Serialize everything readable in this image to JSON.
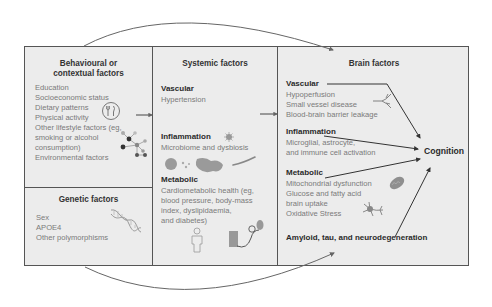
{
  "diagram": {
    "panels": {
      "behavioural": {
        "title_line1": "Behavioural or",
        "title_line2": "contextual factors",
        "items": [
          "Education",
          "Socioeconomic status",
          "Dietary patterns",
          "Physical activity",
          "Other lifestyle factors (eg,",
          "smoking or alcohol",
          "consumption)",
          "Environmental factors"
        ]
      },
      "genetic": {
        "title": "Genetic factors",
        "items": [
          "Sex",
          "APOE4",
          "Other polymorphisms"
        ]
      },
      "systemic": {
        "title": "Systemic factors",
        "vascular": {
          "heading": "Vascular",
          "items": [
            "Hypertension"
          ]
        },
        "inflammation": {
          "heading": "Inflammation",
          "items": [
            "Microbiome and dysbiosis"
          ]
        },
        "metabolic": {
          "heading": "Metabolic",
          "items": [
            "Cardiometabolic health (eg,",
            "blood pressure, body-mass",
            "index, dyslipidaemia,",
            "and diabetes)"
          ]
        }
      },
      "brain": {
        "title": "Brain factors",
        "vascular": {
          "heading": "Vascular",
          "items": [
            "Hypoperfusion",
            "Small vessel disease",
            "Blood-brain barrier leakage"
          ]
        },
        "inflammation": {
          "heading": "Inflammation",
          "items": [
            "Microglial, astrocyte,",
            "and immune cell activation"
          ]
        },
        "metabolic": {
          "heading": "Metabolic",
          "items": [
            "Mitochondrial dysfunction",
            "Glucose and fatty acid",
            "brain uptake",
            "Oxidative Stress"
          ]
        },
        "amyloid": {
          "heading": "Amyloid, tau, and neurodegeneration"
        }
      }
    },
    "outcome": "Cognition",
    "icons": [
      "fork-knife-icon",
      "molecule-network-icon",
      "dna-icon",
      "microbe-icon",
      "person-icon",
      "blood-pressure-cuff-icon",
      "blood-vessel-icon",
      "mitochondria-icon",
      "neuron-icon"
    ],
    "colors": {
      "panel_bg": "#ececec",
      "border": "#555555",
      "text_muted": "#7a7a7a",
      "text_heading": "#2a2a2a",
      "arrow": "#333333"
    }
  }
}
